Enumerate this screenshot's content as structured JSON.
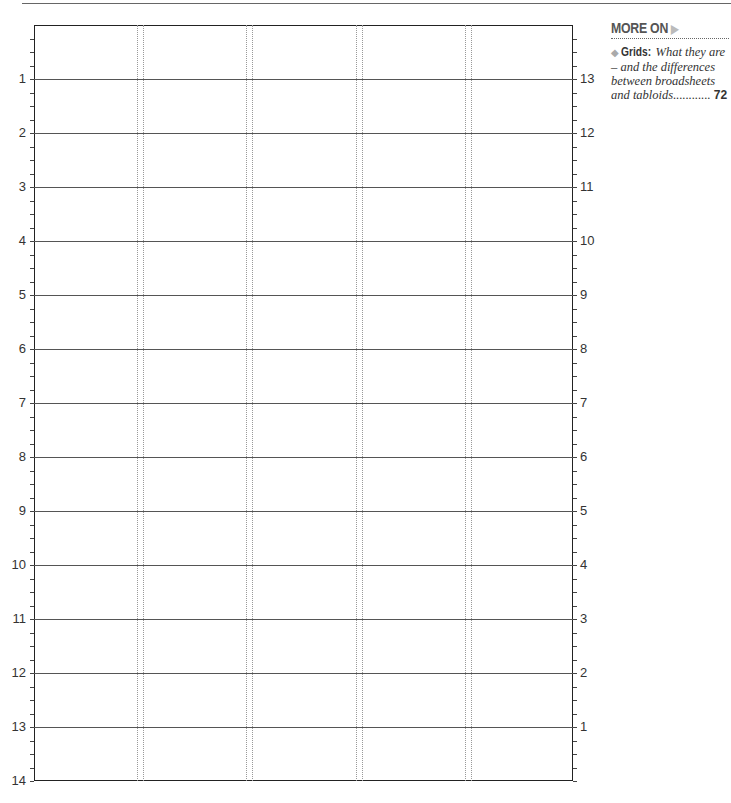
{
  "sidebar": {
    "heading": "MORE ON",
    "arrow_icon": "▶",
    "entry": {
      "bullet": "◆",
      "keyword": "Grids:",
      "text": " What they are – and the differences between broadsheets and tabloids............",
      "page": "72"
    }
  },
  "grid": {
    "rows": 14,
    "columns": 5,
    "left_labels": [
      "1",
      "2",
      "3",
      "4",
      "5",
      "6",
      "7",
      "8",
      "9",
      "10",
      "11",
      "12",
      "13",
      "14"
    ],
    "right_labels": [
      "13",
      "12",
      "11",
      "10",
      "9",
      "8",
      "7",
      "6",
      "5",
      "4",
      "3",
      "2",
      "1"
    ],
    "column_gutters_x": [
      137,
      246,
      356,
      465
    ],
    "colors": {
      "line": "#555555",
      "border": "#222222",
      "gutter": "#999999"
    }
  }
}
